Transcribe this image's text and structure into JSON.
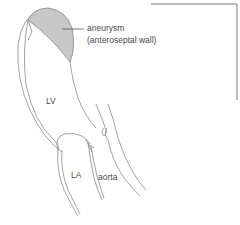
{
  "diagram": {
    "labels": {
      "aneurysm": "aneurysm",
      "aneurysm_detail": "(anteroseptal wall)",
      "lv": "LV",
      "la": "LA",
      "aorta": "aorta"
    },
    "colors": {
      "outline": "#8a8a8a",
      "aneurysm_fill": "#c8c8c8",
      "frame": "#7a7a7a",
      "text": "#4a4a4a"
    }
  }
}
